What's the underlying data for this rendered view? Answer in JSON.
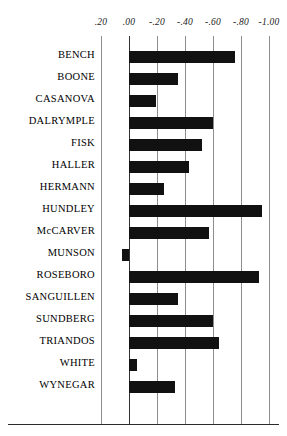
{
  "chart_data": {
    "type": "bar",
    "orientation": "horizontal",
    "title": "",
    "subtitle": "",
    "xlabel": "",
    "ylabel": "",
    "xlim": [
      0.2,
      -1.0
    ],
    "axis_reversed": true,
    "grid": true,
    "legend": null,
    "tick_labels": [
      ".20",
      ".00",
      "-.20",
      "-.40",
      "-.60",
      "-.80",
      "-1.00"
    ],
    "tick_values": [
      0.2,
      0.0,
      -0.2,
      -0.4,
      -0.6,
      -0.8,
      -1.0
    ],
    "baseline_value": 0.0,
    "bar_color": "#111111",
    "gridline_color": "#8d8d8d",
    "categories": [
      "BENCH",
      "BOONE",
      "CASANOVA",
      "DALRYMPLE",
      "FISK",
      "HALLER",
      "HERMANN",
      "HUNDLEY",
      "McCARVER",
      "MUNSON",
      "ROSEBORO",
      "SANGUILLEN",
      "SUNDBERG",
      "TRIANDOS",
      "WHITE",
      "WYNEGAR"
    ],
    "values": [
      -0.76,
      -0.35,
      -0.19,
      -0.6,
      -0.52,
      -0.43,
      -0.25,
      -0.95,
      -0.57,
      0.05,
      -0.93,
      -0.35,
      -0.6,
      -0.64,
      -0.06,
      -0.33
    ],
    "bars": [
      {
        "label": "BENCH",
        "value": -0.76
      },
      {
        "label": "BOONE",
        "value": -0.35
      },
      {
        "label": "CASANOVA",
        "value": -0.19
      },
      {
        "label": "DALRYMPLE",
        "value": -0.6
      },
      {
        "label": "FISK",
        "value": -0.52
      },
      {
        "label": "HALLER",
        "value": -0.43
      },
      {
        "label": "HERMANN",
        "value": -0.25
      },
      {
        "label": "HUNDLEY",
        "value": -0.95
      },
      {
        "label": "McCARVER",
        "value": -0.57
      },
      {
        "label": "MUNSON",
        "value": 0.05
      },
      {
        "label": "ROSEBORO",
        "value": -0.93
      },
      {
        "label": "SANGUILLEN",
        "value": -0.35
      },
      {
        "label": "SUNDBERG",
        "value": -0.6
      },
      {
        "label": "TRIANDOS",
        "value": -0.64
      },
      {
        "label": "WHITE",
        "value": -0.06
      },
      {
        "label": "WYNEGAR",
        "value": -0.33
      }
    ]
  }
}
